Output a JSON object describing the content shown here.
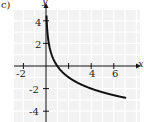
{
  "panel_label": "c)",
  "chart_data": {
    "type": "line",
    "title": "",
    "xlabel": "x",
    "ylabel": "y",
    "xlim": [
      -3,
      7
    ],
    "ylim": [
      -5,
      5
    ],
    "grid": true,
    "x_ticks": [
      "-2",
      "4",
      "6"
    ],
    "y_ticks": [
      "4",
      "2",
      "-2",
      "-4"
    ],
    "series": [
      {
        "name": "y = log_{1/2}(x)",
        "x": [
          0.06,
          0.125,
          0.25,
          0.5,
          1,
          2,
          3,
          4,
          5,
          6,
          7
        ],
        "y": [
          4.06,
          3,
          2,
          1,
          0,
          -1,
          -1.58,
          -2,
          -2.32,
          -2.58,
          -2.81
        ]
      }
    ]
  }
}
